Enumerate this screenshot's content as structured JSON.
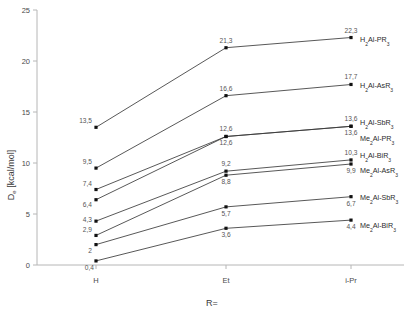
{
  "chart_data": {
    "type": "line",
    "title": "",
    "subtitle": "",
    "xlabel": "R=",
    "ylabel": "D_e [kcal/mol]",
    "ylabel_base": "D",
    "ylabel_sub": "e",
    "ylabel_unit": " [kcal/mol]",
    "categories": [
      "H",
      "Et",
      "i-Pr"
    ],
    "x": [
      0,
      1,
      2
    ],
    "xtick_labels": [
      "H",
      "Et",
      "i-Pr"
    ],
    "ytick_labels": [
      "0",
      "5",
      "10",
      "15",
      "20",
      "25"
    ],
    "ytick_values": [
      0,
      5,
      10,
      15,
      20,
      25
    ],
    "ylim": [
      0,
      25
    ],
    "xlim": [
      -0.5,
      2.5
    ],
    "grid": false,
    "legend": "inline-right-labels",
    "decimal_separator": ",",
    "marker": "square",
    "line_color": "#3a3a3a",
    "marker_color": "#111111",
    "axis_color": "#b6b6b6",
    "series": [
      {
        "name": "H2Al-PR3",
        "label_parts": [
          {
            "t": "H",
            "sub": false
          },
          {
            "t": "2",
            "sub": true
          },
          {
            "t": "Al-PR",
            "sub": false
          },
          {
            "t": "3",
            "sub": true
          }
        ],
        "values": [
          13.5,
          21.3,
          22.3
        ],
        "value_labels": [
          "13,5",
          "21,3",
          "22,3"
        ]
      },
      {
        "name": "H2Al-AsR3",
        "label_parts": [
          {
            "t": "H",
            "sub": false
          },
          {
            "t": "2",
            "sub": true
          },
          {
            "t": "Al-AsR",
            "sub": false
          },
          {
            "t": "3",
            "sub": true
          }
        ],
        "values": [
          9.5,
          16.6,
          17.7
        ],
        "value_labels": [
          "9,5",
          "16,6",
          "17,7"
        ]
      },
      {
        "name": "H2Al-SbR3",
        "label_parts": [
          {
            "t": "H",
            "sub": false
          },
          {
            "t": "2",
            "sub": true
          },
          {
            "t": "Al-SbR",
            "sub": false
          },
          {
            "t": "3",
            "sub": true
          }
        ],
        "values": [
          7.4,
          12.6,
          13.6
        ],
        "value_labels": [
          "7,4",
          "12,6",
          "13,6"
        ]
      },
      {
        "name": "Me2Al-PR3",
        "label_parts": [
          {
            "t": "Me",
            "sub": false
          },
          {
            "t": "2",
            "sub": true
          },
          {
            "t": "Al-PR",
            "sub": false
          },
          {
            "t": "3",
            "sub": true
          }
        ],
        "values": [
          6.4,
          12.6,
          13.6
        ],
        "value_labels": [
          "6,4",
          "12,6",
          "13,6"
        ]
      },
      {
        "name": "H2Al-BiR3",
        "label_parts": [
          {
            "t": "H",
            "sub": false
          },
          {
            "t": "2",
            "sub": true
          },
          {
            "t": "Al-BiR",
            "sub": false
          },
          {
            "t": "3",
            "sub": true
          }
        ],
        "values": [
          4.3,
          9.2,
          10.3
        ],
        "value_labels": [
          "4,3",
          "9,2",
          "10,3"
        ]
      },
      {
        "name": "Me2Al-AsR3",
        "label_parts": [
          {
            "t": "Me",
            "sub": false
          },
          {
            "t": "2",
            "sub": true
          },
          {
            "t": "Al-AsR",
            "sub": false
          },
          {
            "t": "3",
            "sub": true
          }
        ],
        "values": [
          2.9,
          8.8,
          9.9
        ],
        "value_labels": [
          "2,9",
          "8,8",
          "9,9"
        ]
      },
      {
        "name": "Me2Al-SbR3",
        "label_parts": [
          {
            "t": "Me",
            "sub": false
          },
          {
            "t": "2",
            "sub": true
          },
          {
            "t": "Al-SbR",
            "sub": false
          },
          {
            "t": "3",
            "sub": true
          }
        ],
        "values": [
          2.0,
          5.7,
          6.7
        ],
        "value_labels": [
          "2",
          "5,7",
          "6,7"
        ]
      },
      {
        "name": "Me2Al-BiR3",
        "label_parts": [
          {
            "t": "Me",
            "sub": false
          },
          {
            "t": "2",
            "sub": true
          },
          {
            "t": "Al-BiR",
            "sub": false
          },
          {
            "t": "3",
            "sub": true
          }
        ],
        "values": [
          0.4,
          3.6,
          4.4
        ],
        "value_labels": [
          "0,4",
          "3,6",
          "4,4"
        ]
      }
    ],
    "point_label_positions": [
      [
        {
          "dx": -4,
          "dy": -4,
          "anchor": "end"
        },
        {
          "dx": 0,
          "dy": -5,
          "anchor": "middle"
        },
        {
          "dx": 0,
          "dy": -5,
          "anchor": "middle"
        }
      ],
      [
        {
          "dx": -4,
          "dy": -4,
          "anchor": "end"
        },
        {
          "dx": 0,
          "dy": -5,
          "anchor": "middle"
        },
        {
          "dx": 0,
          "dy": -5,
          "anchor": "middle"
        }
      ],
      [
        {
          "dx": -4,
          "dy": -4,
          "anchor": "end"
        },
        {
          "dx": 0,
          "dy": -5,
          "anchor": "middle"
        },
        {
          "dx": 0,
          "dy": -5,
          "anchor": "middle"
        }
      ],
      [
        {
          "dx": -4,
          "dy": 7,
          "anchor": "end"
        },
        {
          "dx": 0,
          "dy": 9,
          "anchor": "middle"
        },
        {
          "dx": 0,
          "dy": 9,
          "anchor": "middle"
        }
      ],
      [
        {
          "dx": -4,
          "dy": 1,
          "anchor": "end"
        },
        {
          "dx": 0,
          "dy": -5,
          "anchor": "middle"
        },
        {
          "dx": 0,
          "dy": -5,
          "anchor": "middle"
        }
      ],
      [
        {
          "dx": -4,
          "dy": -3,
          "anchor": "end"
        },
        {
          "dx": 0,
          "dy": 9,
          "anchor": "middle"
        },
        {
          "dx": 0,
          "dy": 9,
          "anchor": "middle"
        }
      ],
      [
        {
          "dx": -4,
          "dy": 8,
          "anchor": "end"
        },
        {
          "dx": 0,
          "dy": 9,
          "anchor": "middle"
        },
        {
          "dx": 0,
          "dy": 9,
          "anchor": "middle"
        }
      ],
      [
        {
          "dx": -2,
          "dy": 9,
          "anchor": "end"
        },
        {
          "dx": 0,
          "dy": 9,
          "anchor": "middle"
        },
        {
          "dx": 0,
          "dy": 9,
          "anchor": "middle"
        }
      ]
    ],
    "series_label_y": [
      42,
      88,
      125,
      141,
      158,
      173,
      200,
      228
    ]
  }
}
